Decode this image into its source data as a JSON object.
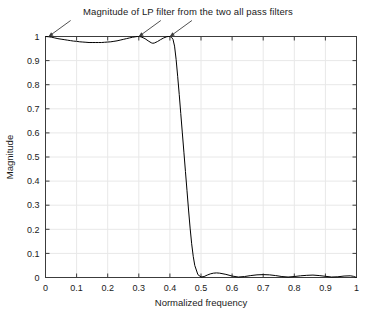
{
  "chart_data": {
    "type": "line",
    "title": "Magnitude of LP filter from the two all pass filters",
    "xlabel": "Normalized frequency",
    "ylabel": "Magnitude",
    "xlim": [
      0,
      1
    ],
    "ylim": [
      0,
      1
    ],
    "grid": true,
    "legend": null,
    "xticks": [
      0,
      0.1,
      0.2,
      0.3,
      0.4,
      0.5,
      0.6,
      0.7,
      0.8,
      0.9,
      1
    ],
    "xtick_labels": [
      "0",
      "0.1",
      "0.2",
      "0.3",
      "0.4",
      "0.5",
      "0.6",
      "0.7",
      "0.8",
      "0.9",
      "1"
    ],
    "yticks": [
      0,
      0.1,
      0.2,
      0.3,
      0.4,
      0.5,
      0.6,
      0.7,
      0.8,
      0.9,
      1
    ],
    "ytick_labels": [
      "0",
      "0.1",
      "0.2",
      "0.3",
      "0.4",
      "0.5",
      "0.6",
      "0.7",
      "0.8",
      "0.9",
      "1"
    ],
    "line_color": "#000000",
    "series": [
      {
        "name": "LP filter magnitude",
        "x": [
          0.0,
          0.01,
          0.02,
          0.03,
          0.04,
          0.05,
          0.06,
          0.07,
          0.08,
          0.09,
          0.1,
          0.11,
          0.12,
          0.13,
          0.14,
          0.15,
          0.16,
          0.17,
          0.18,
          0.19,
          0.2,
          0.21,
          0.22,
          0.23,
          0.24,
          0.25,
          0.26,
          0.27,
          0.28,
          0.29,
          0.295,
          0.3,
          0.305,
          0.31,
          0.32,
          0.33,
          0.34,
          0.345,
          0.35,
          0.36,
          0.37,
          0.38,
          0.39,
          0.395,
          0.4,
          0.405,
          0.41,
          0.415,
          0.42,
          0.425,
          0.43,
          0.435,
          0.44,
          0.445,
          0.45,
          0.455,
          0.46,
          0.465,
          0.47,
          0.475,
          0.48,
          0.49,
          0.5,
          0.51,
          0.52,
          0.53,
          0.54,
          0.55,
          0.56,
          0.58,
          0.6,
          0.62,
          0.64,
          0.66,
          0.68,
          0.7,
          0.72,
          0.74,
          0.76,
          0.78,
          0.8,
          0.82,
          0.84,
          0.86,
          0.88,
          0.9,
          0.92,
          0.94,
          0.96,
          0.98,
          0.99,
          1.0
        ],
        "values": [
          1.0,
          0.999,
          0.997,
          0.994,
          0.991,
          0.989,
          0.987,
          0.985,
          0.983,
          0.981,
          0.98,
          0.978,
          0.977,
          0.976,
          0.975,
          0.975,
          0.975,
          0.975,
          0.975,
          0.976,
          0.977,
          0.978,
          0.98,
          0.982,
          0.985,
          0.988,
          0.991,
          0.994,
          0.997,
          0.999,
          1.0,
          1.0,
          0.999,
          0.997,
          0.991,
          0.982,
          0.974,
          0.972,
          0.973,
          0.979,
          0.987,
          0.994,
          0.999,
          1.0,
          1.0,
          0.997,
          0.988,
          0.96,
          0.905,
          0.835,
          0.76,
          0.68,
          0.6,
          0.52,
          0.44,
          0.36,
          0.28,
          0.205,
          0.14,
          0.088,
          0.05,
          0.012,
          0.002,
          0.004,
          0.01,
          0.015,
          0.018,
          0.019,
          0.018,
          0.013,
          0.006,
          0.002,
          0.004,
          0.008,
          0.011,
          0.012,
          0.011,
          0.008,
          0.004,
          0.002,
          0.004,
          0.007,
          0.009,
          0.01,
          0.008,
          0.005,
          0.002,
          0.003,
          0.006,
          0.007,
          0.005,
          0.0
        ]
      }
    ],
    "annotations": [
      {
        "label": "arrow-to-passband-start",
        "target_x": 0.01,
        "target_y": 1.0,
        "tail_dx": 22,
        "tail_dy": -16
      },
      {
        "label": "arrow-to-ripple-peak-1",
        "target_x": 0.3,
        "target_y": 1.0,
        "tail_dx": 22,
        "tail_dy": -16
      },
      {
        "label": "arrow-to-ripple-peak-2",
        "target_x": 0.4,
        "target_y": 1.0,
        "tail_dx": 22,
        "tail_dy": -16
      }
    ]
  }
}
